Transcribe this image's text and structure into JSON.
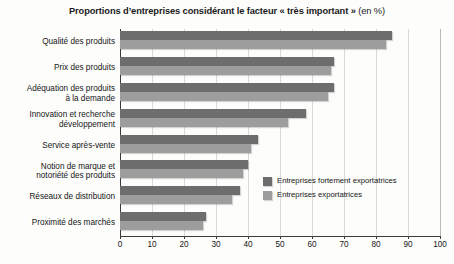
{
  "chart_data": {
    "type": "bar",
    "orientation": "horizontal",
    "title": "Proportions d’entreprises considérant le facteur « très important » (en %)",
    "title_main": "Proportions d’entreprises considérant le facteur « très important »",
    "title_unit": " (en %)",
    "xlabel": "",
    "ylabel": "",
    "xlim": [
      0,
      100
    ],
    "xticks": [
      0,
      10,
      20,
      30,
      40,
      50,
      60,
      70,
      80,
      90,
      100
    ],
    "xtick_labels": [
      "0",
      "10",
      "20",
      "30",
      "40",
      "50",
      "60",
      "70",
      "80",
      "90",
      "100"
    ],
    "grid": true,
    "grid_axis": "x",
    "legend_position": "inside-right",
    "categories": [
      "Qualité des produits",
      "Prix des produits",
      "Adéquation des produits\nà la demande",
      "Innovation et recherche\ndéveloppement",
      "Service après-vente",
      "Notion de marque et\nnotoriété des produits",
      "Réseaux de distribution",
      "Proximité des marchés"
    ],
    "series": [
      {
        "name": "Entreprises fortement exportatrices",
        "color": "#6d6d6d",
        "values": [
          85,
          67,
          67,
          58,
          43,
          40,
          37.5,
          27
        ]
      },
      {
        "name": "Entreprises exportatrices",
        "color": "#9d9d9d",
        "values": [
          83,
          66,
          65,
          52.5,
          41,
          38.5,
          35,
          26
        ]
      }
    ]
  },
  "legend": {
    "items": [
      {
        "label": "Entreprises fortement exportatrices",
        "color": "#6d6d6d"
      },
      {
        "label": "Entreprises exportatrices",
        "color": "#9d9d9d"
      }
    ]
  }
}
